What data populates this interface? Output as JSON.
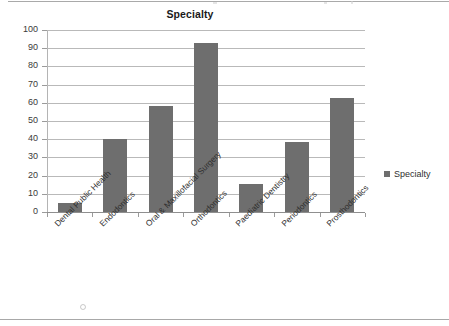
{
  "chart_data": {
    "type": "bar",
    "title": "Specialty",
    "xlabel": "",
    "ylabel": "",
    "ylim": [
      0,
      100
    ],
    "ytick_labels": [
      "100",
      "90",
      "80",
      "70",
      "60",
      "50",
      "40",
      "30",
      "20",
      "10",
      "0"
    ],
    "ytick_values": [
      100,
      90,
      80,
      70,
      60,
      50,
      40,
      30,
      20,
      10,
      0
    ],
    "grid": true,
    "legend_position": "right",
    "series_color": "#6e6e6e",
    "categories": [
      "Dental Public Health",
      "Endodontics",
      "Oral & Maxillofacial Surgery",
      "Orthodontics",
      "Paediatric Dentistry",
      "Periodontics",
      "Prosthodontics"
    ],
    "series": [
      {
        "name": "Specialty",
        "values": [
          5,
          40,
          58,
          93,
          15.5,
          38.5,
          62.5
        ]
      }
    ]
  },
  "legend": {
    "entries": [
      {
        "label": "Specialty",
        "color": "#6e6e6e",
        "marker": "square-marker"
      }
    ]
  }
}
